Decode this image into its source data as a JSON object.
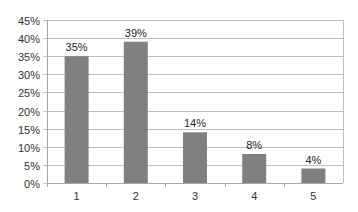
{
  "chart_data": {
    "type": "bar",
    "title": "",
    "xlabel": "",
    "ylabel": "",
    "categories": [
      "1",
      "2",
      "3",
      "4",
      "5"
    ],
    "values": [
      35,
      39,
      14,
      8,
      4
    ],
    "data_labels": [
      "35%",
      "39%",
      "14%",
      "8%",
      "4%"
    ],
    "yticks": [
      "0%",
      "5%",
      "10%",
      "15%",
      "20%",
      "25%",
      "30%",
      "35%",
      "40%",
      "45%"
    ],
    "ylim": [
      0,
      45
    ],
    "grid": true,
    "legend": null,
    "colors": {
      "bar": "#808080",
      "grid": "#bfbfbf",
      "axis": "#a6a6a6"
    }
  }
}
